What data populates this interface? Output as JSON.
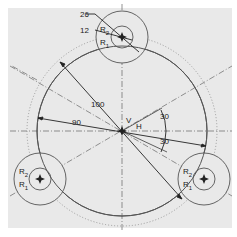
{
  "drawing": {
    "background": "#e9e9e9",
    "line_color": "#555555",
    "dim_color": "#222222",
    "center": {
      "x": 122,
      "y": 131
    },
    "main_circle_radius_px": 85,
    "bolt_circle_radius_px": 95,
    "holes": [
      {
        "id": "top",
        "x": 122,
        "y": 37
      },
      {
        "id": "bottom-left",
        "x": 40,
        "y": 179
      },
      {
        "id": "bottom-right",
        "x": 204,
        "y": 179
      }
    ],
    "hole_outer_radius_px": 26,
    "hole_inner_radius_px": 11
  },
  "labels": {
    "dim_26": "26",
    "dim_12": "12",
    "dim_100": "100",
    "dim_90": "90",
    "angle_30_top": "30",
    "angle_30_bottom": "30",
    "v": "V",
    "h": "H",
    "r": "R",
    "sub1": "1",
    "sub2": "2"
  }
}
